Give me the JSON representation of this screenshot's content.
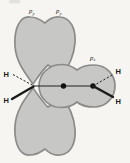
{
  "diagram": {
    "labels": {
      "py_left": {
        "main": "p",
        "sub": "y"
      },
      "py_right": {
        "main": "p",
        "sub": "y"
      },
      "pz": {
        "main": "p",
        "sub": "z"
      },
      "h_top_left": "H",
      "h_bottom_left": "H",
      "h_top_right": "H",
      "h_bottom_right": "H"
    },
    "colors": {
      "background": "#f6f5f2",
      "orbital_fill": "#c7c7c5",
      "orbital_edge": "#8b8b89",
      "ink": "#222222"
    }
  }
}
